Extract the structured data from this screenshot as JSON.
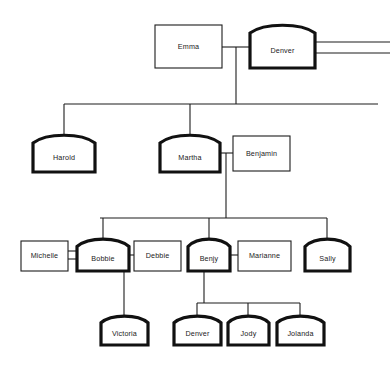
{
  "diagram": {
    "type": "family-tree",
    "canvas": {
      "width": 390,
      "height": 370
    },
    "style": {
      "background": "#ffffff",
      "line_color": "#1c1c1c",
      "plain_box_stroke": "#1c1c1c",
      "arched_box_stroke": "#111111",
      "box_fill": "#ffffff",
      "text_color": "#1a1a1a"
    },
    "legend": {
      "arched_thick": "arched top, thick border",
      "plain_rect": "plain rectangle, thin border",
      "double_line": "double horizontal line relationship link",
      "single_line": "single line relationship link"
    },
    "generations": [
      {
        "index": 1,
        "y": 25,
        "members": [
          "Emma",
          "Denver"
        ]
      },
      {
        "index": 2,
        "y": 130,
        "members": [
          "Harold",
          "Martha",
          "Benjamin"
        ]
      },
      {
        "index": 3,
        "y": 238,
        "members": [
          "Michelle",
          "Bobbie",
          "Debbie",
          "Benjy",
          "Marianne",
          "Sally"
        ]
      },
      {
        "index": 4,
        "y": 315,
        "members": [
          "Victoria",
          "Denver",
          "Jody",
          "Jolanda"
        ]
      }
    ],
    "nodes": [
      {
        "id": "emma",
        "label": "Emma",
        "shape": "plain",
        "x": 155,
        "y": 25,
        "w": 67,
        "h": 43
      },
      {
        "id": "denver1",
        "label": "Denver",
        "shape": "arched",
        "x": 250,
        "y": 24,
        "w": 65,
        "h": 44
      },
      {
        "id": "harold",
        "label": "Harold",
        "shape": "arched",
        "x": 33,
        "y": 134,
        "w": 62,
        "h": 38
      },
      {
        "id": "martha",
        "label": "Martha",
        "shape": "arched",
        "x": 160,
        "y": 134,
        "w": 60,
        "h": 38
      },
      {
        "id": "benjamin",
        "label": "Benjamin",
        "shape": "plain",
        "x": 233,
        "y": 136,
        "w": 57,
        "h": 35
      },
      {
        "id": "michelle",
        "label": "Michelle",
        "shape": "plain",
        "x": 21,
        "y": 241,
        "w": 47,
        "h": 30
      },
      {
        "id": "bobbie",
        "label": "Bobbie",
        "shape": "arched",
        "x": 77,
        "y": 238,
        "w": 52,
        "h": 33
      },
      {
        "id": "debbie",
        "label": "Debbie",
        "shape": "plain",
        "x": 134,
        "y": 241,
        "w": 47,
        "h": 30
      },
      {
        "id": "benjy",
        "label": "Benjy",
        "shape": "arched",
        "x": 188,
        "y": 238,
        "w": 42,
        "h": 33
      },
      {
        "id": "marianne",
        "label": "Marianne",
        "shape": "plain",
        "x": 238,
        "y": 241,
        "w": 53,
        "h": 30
      },
      {
        "id": "sally",
        "label": "Sally",
        "shape": "arched",
        "x": 305,
        "y": 238,
        "w": 45,
        "h": 33
      },
      {
        "id": "victoria",
        "label": "Victoria",
        "shape": "arched",
        "x": 101,
        "y": 315,
        "w": 47,
        "h": 30
      },
      {
        "id": "denver2",
        "label": "Denver",
        "shape": "arched",
        "x": 174,
        "y": 315,
        "w": 47,
        "h": 30
      },
      {
        "id": "jody",
        "label": "Jody",
        "shape": "arched",
        "x": 228,
        "y": 315,
        "w": 41,
        "h": 30
      },
      {
        "id": "jolanda",
        "label": "Jolanda",
        "shape": "arched",
        "x": 277,
        "y": 315,
        "w": 47,
        "h": 30
      }
    ],
    "unions": [
      {
        "id": "u1",
        "partners": [
          "Emma",
          "Denver"
        ],
        "link": "single",
        "children": [
          "Harold",
          "Martha"
        ]
      },
      {
        "id": "u2",
        "partners": [
          "Denver",
          "offscreen"
        ],
        "link": "double",
        "children": []
      },
      {
        "id": "u3",
        "partners": [
          "Martha",
          "Benjamin"
        ],
        "link": "single",
        "children": [
          "Bobbie",
          "Benjy",
          "Sally"
        ]
      },
      {
        "id": "u4",
        "partners": [
          "Michelle",
          "Bobbie"
        ],
        "link": "double",
        "children": []
      },
      {
        "id": "u5",
        "partners": [
          "Bobbie",
          "Debbie"
        ],
        "link": "single",
        "children": [
          "Victoria"
        ]
      },
      {
        "id": "u6",
        "partners": [
          "Benjy",
          "Marianne"
        ],
        "link": "single",
        "children": [
          "Denver",
          "Jody",
          "Jolanda"
        ]
      }
    ],
    "edges": [
      {
        "name": "emma-denver-link",
        "kind": "single",
        "points": "222,47 250,47"
      },
      {
        "name": "denver-offscreen-link-a",
        "kind": "double",
        "points": "315,42 390,42"
      },
      {
        "name": "denver-offscreen-link-b",
        "kind": "double",
        "points": "315,53 390,53"
      },
      {
        "name": "u1-drop",
        "kind": "single",
        "points": "236,47 236,104"
      },
      {
        "name": "u1-bus",
        "kind": "single",
        "points": "64,104 378,104"
      },
      {
        "name": "u1-to-harold",
        "kind": "single",
        "points": "64,104 64,134"
      },
      {
        "name": "u1-to-martha",
        "kind": "single",
        "points": "190,104 190,134"
      },
      {
        "name": "martha-benjamin-link",
        "kind": "single",
        "points": "220,153 233,153"
      },
      {
        "name": "u3-drop",
        "kind": "single",
        "points": "226,153 226,218"
      },
      {
        "name": "u3-bus",
        "kind": "single",
        "points": "100,218 327,218"
      },
      {
        "name": "u3-to-bobbie",
        "kind": "single",
        "points": "103,218 103,238"
      },
      {
        "name": "u3-to-benjy",
        "kind": "single",
        "points": "209,218 209,238"
      },
      {
        "name": "u3-to-sally",
        "kind": "single",
        "points": "327,218 327,238"
      },
      {
        "name": "michelle-bobbie-link-a",
        "kind": "double",
        "points": "68,251 77,251"
      },
      {
        "name": "michelle-bobbie-link-b",
        "kind": "double",
        "points": "68,259 77,259"
      },
      {
        "name": "bobbie-debbie-link",
        "kind": "single",
        "points": "129,255 134,255"
      },
      {
        "name": "u5-drop",
        "kind": "single",
        "points": "124,255 124,315"
      },
      {
        "name": "benjy-marianne-link",
        "kind": "single",
        "points": "230,255 238,255"
      },
      {
        "name": "u6-drop",
        "kind": "single",
        "points": "204,255 204,303"
      },
      {
        "name": "u6-bus",
        "kind": "single",
        "points": "197,303 300,303"
      },
      {
        "name": "u6-to-denver2",
        "kind": "single",
        "points": "197,303 197,315"
      },
      {
        "name": "u6-to-jody",
        "kind": "single",
        "points": "248,303 248,315"
      },
      {
        "name": "u6-to-jolanda",
        "kind": "single",
        "points": "300,303 300,315"
      }
    ]
  }
}
